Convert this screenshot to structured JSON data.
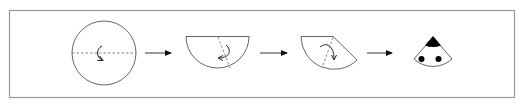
{
  "diagram": {
    "steps": [
      {
        "id": 1,
        "shape": "circle",
        "fold": "fold in half along dashed horizontal diameter",
        "fold_arrow": "curved-down-arrow"
      },
      {
        "id": 2,
        "shape": "semicircle",
        "fold": "fold along dashed diagonal line",
        "fold_arrow": "curved-left-arrow"
      },
      {
        "id": 3,
        "shape": "fan",
        "fold": "fold along dashed diagonal line",
        "fold_arrow": "curved-right-arrow"
      },
      {
        "id": 4,
        "shape": "sector-face",
        "features": [
          "black-tip",
          "left-eye",
          "right-eye"
        ]
      }
    ],
    "connectors": [
      "right-arrow",
      "right-arrow",
      "right-arrow"
    ],
    "colors": {
      "stroke": "#555555",
      "frame": "#9a9a9a",
      "dash": "#777777",
      "fill_dark": "#000000",
      "background": "#ffffff"
    }
  }
}
